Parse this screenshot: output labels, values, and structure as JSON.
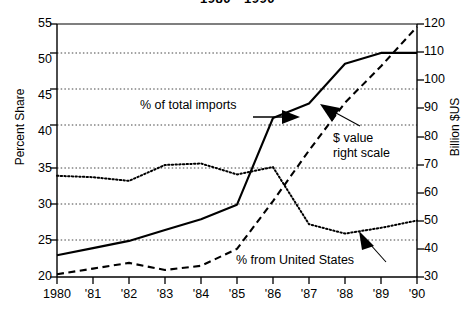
{
  "chart_data": {
    "type": "line",
    "title": "1980 - 1990",
    "xlabel": "",
    "ylabel": "Percent Share",
    "ylabel_right": "Billion $US",
    "x": [
      "1980",
      "'81",
      "'82",
      "'83",
      "'84",
      "'85",
      "'86",
      "'87",
      "'88",
      "'89",
      "'90"
    ],
    "years": [
      1980,
      1981,
      1982,
      1983,
      1984,
      1985,
      1986,
      1987,
      1988,
      1989,
      1990
    ],
    "ylim": [
      20,
      55
    ],
    "yticks": [
      20,
      25,
      30,
      35,
      40,
      45,
      50,
      55
    ],
    "ylim_right": [
      30,
      120
    ],
    "yticks_right": [
      30,
      40,
      50,
      60,
      70,
      80,
      90,
      100,
      110,
      120
    ],
    "grid": true,
    "grid_style": "dotted-horizontal",
    "legend": "none",
    "series": [
      {
        "name": "% of total imports",
        "axis": "left",
        "style": "solid",
        "values": [
          23.0,
          24.0,
          25.0,
          26.5,
          28.0,
          30.0,
          42.0,
          44.0,
          49.5,
          51.0,
          51.0
        ]
      },
      {
        "name": "% from United States",
        "axis": "left",
        "style": "dotted",
        "values": [
          34.0,
          33.8,
          33.3,
          35.5,
          35.7,
          34.2,
          35.2,
          27.3,
          26.0,
          26.8,
          27.8
        ]
      },
      {
        "name": "$ value right scale",
        "axis": "right",
        "style": "dashed",
        "values": [
          31.0,
          33.0,
          35.0,
          32.5,
          34.0,
          40.0,
          57.0,
          75.0,
          92.0,
          105.0,
          119.0
        ]
      }
    ],
    "annotations": [
      {
        "id": "total-imports",
        "text": "% of total imports",
        "text_line2": ""
      },
      {
        "id": "dollar-value",
        "text": "$ value",
        "text_line2": "right scale"
      },
      {
        "id": "united-states",
        "text": "% from United States",
        "text_line2": ""
      }
    ]
  },
  "axes": {
    "left_title": "Percent Share",
    "right_title": "Billion $US",
    "left_ticks": [
      "55",
      "50",
      "45",
      "40",
      "35",
      "30",
      "25",
      "20"
    ],
    "right_ticks": [
      "120",
      "110",
      "100",
      "90",
      "80",
      "70",
      "60",
      "50",
      "40",
      "30"
    ],
    "x_ticks": [
      "1980",
      "'81",
      "'82",
      "'83",
      "'84",
      "'85",
      "'86",
      "'87",
      "'88",
      "'89",
      "'90"
    ]
  },
  "colors": {
    "line": "#000000",
    "grid": "#555555",
    "background": "#ffffff"
  }
}
